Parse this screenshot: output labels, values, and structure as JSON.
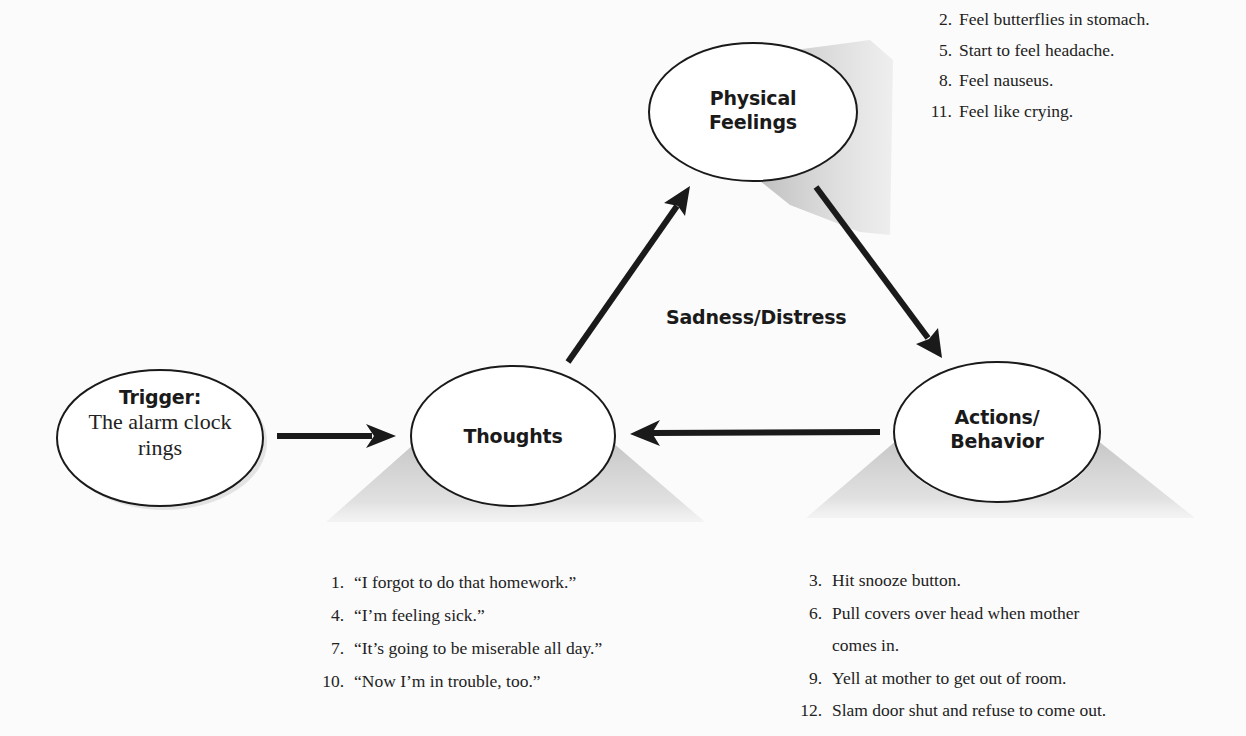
{
  "diagram": {
    "center_label": "Sadness/Distress",
    "colors": {
      "background": "#fbfbfb",
      "ink": "#1a1a1a",
      "shadow": "#c8c8c8"
    },
    "nodes": {
      "trigger": {
        "title": "Trigger:",
        "line1": "The alarm clock",
        "line2": "rings"
      },
      "thoughts": {
        "title": "Thoughts"
      },
      "physical": {
        "line1": "Physical",
        "line2": "Feelings"
      },
      "actions": {
        "line1": "Actions/",
        "line2": "Behavior"
      }
    },
    "arrows": [
      {
        "from": "Trigger",
        "to": "Thoughts"
      },
      {
        "from": "Thoughts",
        "to": "Physical Feelings"
      },
      {
        "from": "Physical Feelings",
        "to": "Actions/Behavior"
      },
      {
        "from": "Actions/Behavior",
        "to": "Thoughts"
      }
    ],
    "physical_list": [
      {
        "num": "2.",
        "text": "Feel butterflies in stomach."
      },
      {
        "num": "5.",
        "text": "Start to feel headache."
      },
      {
        "num": "8.",
        "text": "Feel nauseus."
      },
      {
        "num": "11.",
        "text": "Feel like crying."
      }
    ],
    "thoughts_list": [
      {
        "num": "1.",
        "text": "“I forgot to do that homework.”"
      },
      {
        "num": "4.",
        "text": "“I’m feeling sick.”"
      },
      {
        "num": "7.",
        "text": "“It’s going to be miserable all day.”"
      },
      {
        "num": "10.",
        "text": "“Now I’m in trouble, too.”"
      }
    ],
    "actions_list": [
      {
        "num": "3.",
        "text": "Hit snooze button."
      },
      {
        "num": "6.",
        "text": "Pull covers over head when mother",
        "cont": "comes in."
      },
      {
        "num": "9.",
        "text": "Yell at mother to get out of room."
      },
      {
        "num": "12.",
        "text": "Slam door shut and refuse to come out."
      }
    ]
  }
}
